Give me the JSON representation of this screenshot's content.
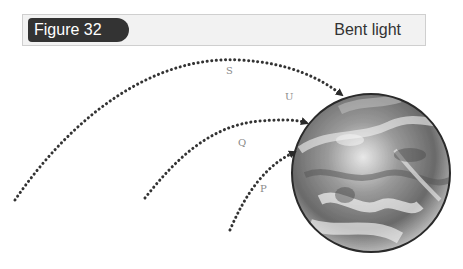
{
  "header": {
    "figure_label": "Figure 32",
    "title": "Bent light"
  },
  "diagram": {
    "paths": [
      {
        "id": "S",
        "label": "S"
      },
      {
        "id": "U",
        "label": "U"
      },
      {
        "id": "Q",
        "label": "Q"
      },
      {
        "id": "P",
        "label": "P"
      }
    ],
    "target": "Earth",
    "colors": {
      "pill": "#333333",
      "header_bg": "#f2f2f2",
      "dots": "#333333",
      "labels": "#8a8a8a"
    }
  }
}
